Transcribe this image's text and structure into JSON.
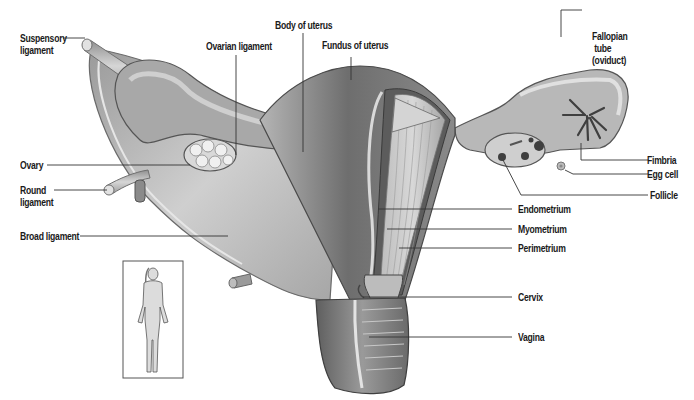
{
  "diagram": {
    "inset": "Full female figure showing body position",
    "labels": {
      "suspensory_ligament": "Suspensory\nligament",
      "ovarian_ligament": "Ovarian ligament",
      "body_of_uterus": "Body of uterus",
      "fundus_of_uterus": "Fundus of uterus",
      "fallopian_tube": "Fallopian\n tube\n(oviduct)",
      "ovary": "Ovary",
      "round_ligament": "Round\nligament",
      "broad_ligament": "Broad ligament",
      "fimbria": "Fimbria",
      "egg_cell": "Egg cell",
      "follicle": "Follicle",
      "endometrium": "Endometrium",
      "myometrium": "Myometrium",
      "perimetrium": "Perimetrium",
      "cervix": "Cervix",
      "vagina": "Vagina"
    },
    "colors": {
      "background": "#ffffff",
      "leader_line": "#333333",
      "tissue_dark": "#5a5a5a",
      "tissue_mid": "#8c8c8c",
      "tissue_light": "#c8c8c8",
      "text": "#1a1a1a"
    }
  }
}
